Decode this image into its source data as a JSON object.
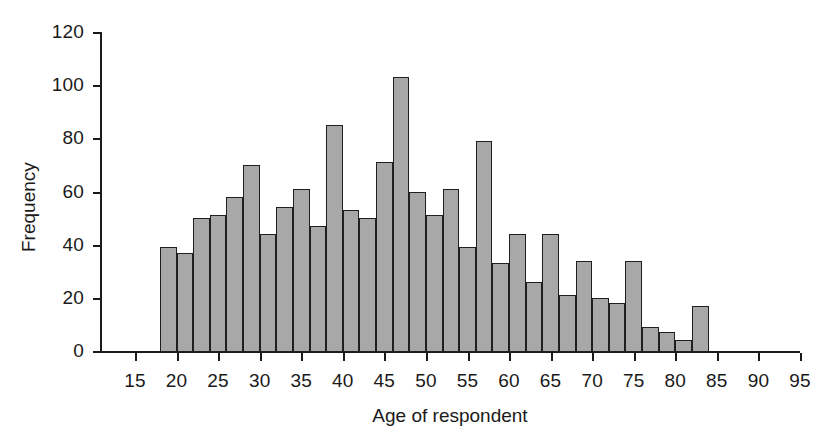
{
  "chart_data": {
    "type": "bar",
    "title": "",
    "subtitle": "",
    "xlabel": "Age of respondent",
    "ylabel": "Frequency",
    "xlim": [
      12,
      95
    ],
    "ylim": [
      0,
      120
    ],
    "grid": false,
    "legend": null,
    "bin_width": 2,
    "x_ticks": [
      15,
      20,
      25,
      30,
      35,
      40,
      45,
      50,
      55,
      60,
      65,
      70,
      75,
      80,
      85,
      90,
      95
    ],
    "y_ticks": [
      0,
      20,
      40,
      60,
      80,
      100,
      120
    ],
    "bar_color": "#a8a8a8",
    "bar_edge_color": "#1f1f1f",
    "axis_color": "#1a1a1a",
    "bin_starts": [
      18,
      20,
      22,
      24,
      26,
      28,
      30,
      32,
      34,
      36,
      38,
      40,
      42,
      44,
      46,
      48,
      50,
      52,
      54,
      56,
      58,
      60,
      62,
      64,
      66,
      68,
      70,
      72,
      74,
      76,
      78,
      80,
      82,
      84,
      86,
      88
    ],
    "bin_labels": [
      "18-20",
      "20-22",
      "22-24",
      "24-26",
      "26-28",
      "28-30",
      "30-32",
      "32-34",
      "34-36",
      "36-38",
      "38-40",
      "40-42",
      "42-44",
      "44-46",
      "46-48",
      "48-50",
      "50-52",
      "52-54",
      "54-56",
      "56-58",
      "58-60",
      "60-62",
      "62-64",
      "64-66",
      "66-68",
      "68-70",
      "70-72",
      "72-74",
      "74-76",
      "76-78",
      "78-80",
      "80-82",
      "82-84",
      "84-86",
      "86-88",
      "88-90"
    ],
    "values": [
      39,
      37,
      50,
      51,
      58,
      70,
      44,
      54,
      61,
      47,
      85,
      53,
      50,
      71,
      103,
      60,
      51,
      61,
      39,
      79,
      33,
      44,
      26,
      44,
      21,
      34,
      20,
      18,
      34,
      9,
      7,
      4,
      17
    ],
    "categories": [
      "18-20",
      "20-22",
      "22-24",
      "24-26",
      "26-28",
      "28-30",
      "30-32",
      "32-34",
      "34-36",
      "36-38",
      "38-40",
      "40-42",
      "42-44",
      "44-46",
      "46-48",
      "48-50",
      "50-52",
      "52-54",
      "54-56",
      "56-58",
      "58-60",
      "60-62",
      "62-64",
      "64-66",
      "66-68",
      "68-70",
      "70-72",
      "72-74",
      "74-76",
      "76-78",
      "78-80",
      "80-82",
      "82-84"
    ],
    "bars": [
      {
        "start": 18,
        "end": 20,
        "value": 39
      },
      {
        "start": 20,
        "end": 22,
        "value": 37
      },
      {
        "start": 22,
        "end": 24,
        "value": 50
      },
      {
        "start": 24,
        "end": 26,
        "value": 51
      },
      {
        "start": 26,
        "end": 28,
        "value": 58
      },
      {
        "start": 28,
        "end": 30,
        "value": 70
      },
      {
        "start": 30,
        "end": 32,
        "value": 44
      },
      {
        "start": 32,
        "end": 34,
        "value": 54
      },
      {
        "start": 34,
        "end": 36,
        "value": 61
      },
      {
        "start": 36,
        "end": 38,
        "value": 47
      },
      {
        "start": 38,
        "end": 40,
        "value": 85
      },
      {
        "start": 40,
        "end": 42,
        "value": 53
      },
      {
        "start": 42,
        "end": 44,
        "value": 50
      },
      {
        "start": 44,
        "end": 46,
        "value": 71
      },
      {
        "start": 46,
        "end": 48,
        "value": 103
      },
      {
        "start": 48,
        "end": 50,
        "value": 60
      },
      {
        "start": 50,
        "end": 52,
        "value": 51
      },
      {
        "start": 52,
        "end": 54,
        "value": 61
      },
      {
        "start": 54,
        "end": 56,
        "value": 39
      },
      {
        "start": 56,
        "end": 58,
        "value": 79
      },
      {
        "start": 58,
        "end": 60,
        "value": 33
      },
      {
        "start": 60,
        "end": 62,
        "value": 44
      },
      {
        "start": 62,
        "end": 64,
        "value": 26
      },
      {
        "start": 64,
        "end": 66,
        "value": 44
      },
      {
        "start": 66,
        "end": 68,
        "value": 21
      },
      {
        "start": 68,
        "end": 70,
        "value": 34
      },
      {
        "start": 70,
        "end": 72,
        "value": 20
      },
      {
        "start": 72,
        "end": 74,
        "value": 18
      },
      {
        "start": 74,
        "end": 76,
        "value": 34
      },
      {
        "start": 76,
        "end": 78,
        "value": 9
      },
      {
        "start": 78,
        "end": 80,
        "value": 7
      },
      {
        "start": 80,
        "end": 82,
        "value": 4
      },
      {
        "start": 82,
        "end": 84,
        "value": 17
      }
    ]
  }
}
